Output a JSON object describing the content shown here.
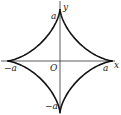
{
  "figure": {
    "curve": "astroid",
    "equation": "x^(2/3) + y^(2/3) = a^(2/3)",
    "colors": {
      "curve": "#111111",
      "axis": "#333333",
      "label": "#222222"
    }
  },
  "labels": {
    "y_axis": "y",
    "x_axis": "x",
    "origin": "O",
    "top": "a",
    "right": "a",
    "left": "−a",
    "bottom": "−a"
  }
}
